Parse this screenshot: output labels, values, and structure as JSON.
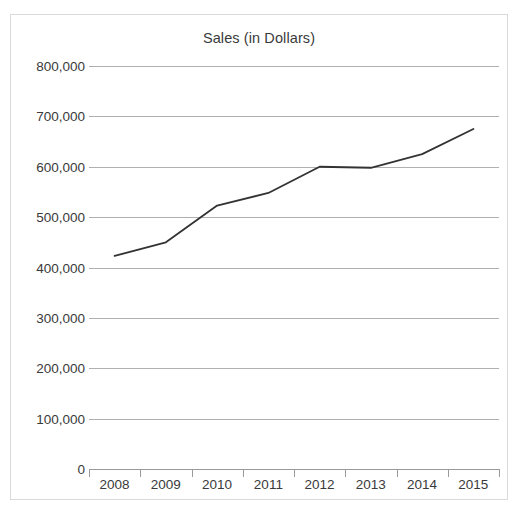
{
  "chart_data": {
    "type": "line",
    "title": "Sales (in Dollars)",
    "xlabel": "",
    "ylabel": "",
    "categories": [
      "2008",
      "2009",
      "2010",
      "2011",
      "2012",
      "2013",
      "2014",
      "2015"
    ],
    "x": [
      2008,
      2009,
      2010,
      2011,
      2012,
      2013,
      2014,
      2015
    ],
    "series": [
      {
        "name": "Sales",
        "values": [
          423000,
          450000,
          523000,
          548000,
          600000,
          598000,
          625000,
          675000
        ],
        "color": "#333333"
      }
    ],
    "ylim": [
      0,
      800000
    ],
    "yticks": [
      0,
      100000,
      200000,
      300000,
      400000,
      500000,
      600000,
      700000,
      800000
    ],
    "ytick_labels": [
      "0",
      "100,000",
      "200,000",
      "300,000",
      "400,000",
      "500,000",
      "600,000",
      "700,000",
      "800,000"
    ],
    "grid": true,
    "grid_axis": "y",
    "legend": false,
    "legend_position": "none",
    "markers": false,
    "line_width": 1.8
  },
  "figure": {
    "background_color": "#ffffff",
    "border_color": "#d9d9d9",
    "gridline_color": "#b0b0b0",
    "axis_color": "#9a9a9a",
    "text_color": "#3a3a3a"
  }
}
